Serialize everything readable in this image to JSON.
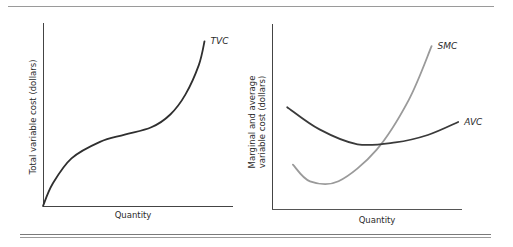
{
  "chart_data": [
    {
      "type": "line",
      "id": "left",
      "title": "",
      "xlabel": "Quantity",
      "ylabel": "Total variable cost (dollars)",
      "xlim": [
        0,
        10
      ],
      "ylim": [
        0,
        10
      ],
      "grid": false,
      "ticks": "none",
      "series": [
        {
          "name": "TVC",
          "color": "#2f2f2f",
          "points": [
            [
              0,
              0
            ],
            [
              0.5,
              1.2
            ],
            [
              1.5,
              2.6
            ],
            [
              3,
              3.5
            ],
            [
              4.3,
              3.9
            ],
            [
              5.7,
              4.3
            ],
            [
              6.7,
              5
            ],
            [
              7.5,
              6.1
            ],
            [
              8.2,
              7.7
            ],
            [
              8.5,
              9
            ]
          ]
        }
      ]
    },
    {
      "type": "line",
      "id": "right",
      "title": "",
      "xlabel": "Quantity",
      "ylabel_lines": [
        "Marginal and average",
        "variable cost (dollars)"
      ],
      "ylabel": "Marginal and average variable cost (dollars)",
      "xlim": [
        0,
        10
      ],
      "ylim": [
        0,
        10
      ],
      "grid": false,
      "ticks": "none",
      "series": [
        {
          "name": "SMC",
          "color": "#9a9a9a",
          "points": [
            [
              1.1,
              2.4
            ],
            [
              2,
              1.5
            ],
            [
              3.5,
              1.5
            ],
            [
              5.5,
              3.2
            ],
            [
              7.2,
              5.9
            ],
            [
              8.4,
              8.8
            ]
          ]
        },
        {
          "name": "AVC",
          "color": "#3a3a3a",
          "points": [
            [
              0.8,
              5.5
            ],
            [
              2.5,
              4.3
            ],
            [
              4.5,
              3.5
            ],
            [
              6.5,
              3.6
            ],
            [
              8.2,
              4.0
            ],
            [
              9.8,
              4.7
            ]
          ]
        }
      ]
    }
  ]
}
